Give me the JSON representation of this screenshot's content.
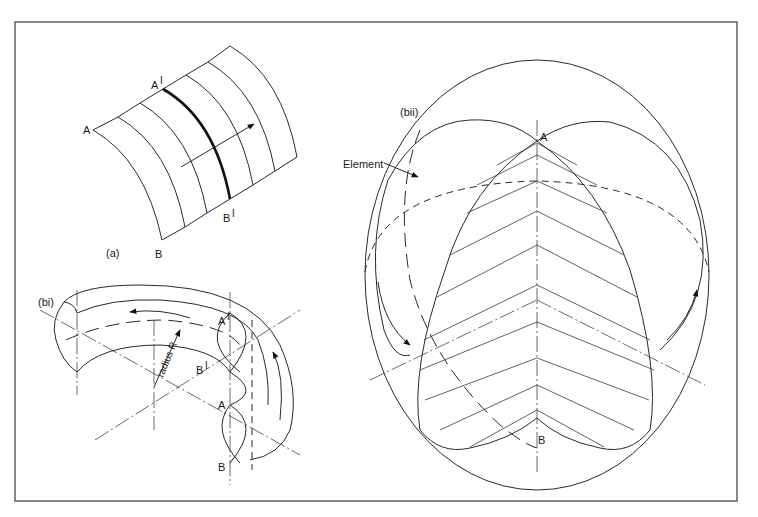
{
  "figure": {
    "frame": {
      "x": 15,
      "y": 22,
      "width": 722,
      "height": 479,
      "color": "#555555"
    },
    "panel_a": {
      "label": "(a)",
      "points": {
        "A": "A",
        "A_prime": "A",
        "B": "B",
        "B_prime": "B"
      },
      "prime_mark": "I",
      "description": "Curved strip surface with generator lines; bold line A'B' with direction arrow"
    },
    "panel_bi": {
      "label": "(bi)",
      "points": {
        "A": "A",
        "A_prime": "A",
        "B": "B",
        "B_prime": "B"
      },
      "prime_mark": "I",
      "radius_label": "radius R",
      "description": "Toroidal shell sector swept about centre with radius R; rotation arrows"
    },
    "panel_bii": {
      "label": "(bii)",
      "element_label": "Element",
      "points": {
        "A": "A",
        "B": "B"
      },
      "description": "Sphere with lune-shaped element hatched by chevron lines between A and B; dashed equator and meridian"
    }
  }
}
